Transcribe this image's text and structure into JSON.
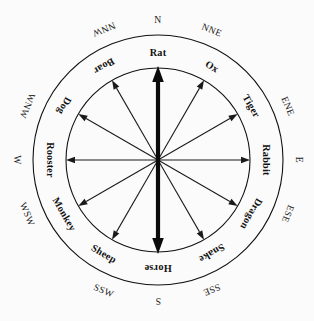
{
  "figure": {
    "background_color": "#fbfbfb",
    "line_color": "#111111"
  },
  "chart_data": {
    "type": "pie",
    "title": "",
    "subtitle": "",
    "xlabel": "",
    "ylabel": "",
    "grid": false,
    "legend_position": "none",
    "center": {
      "x": 158,
      "y": 160
    },
    "radii": {
      "inner_ring": 92,
      "outer_ring": 125,
      "arrow_length": 92
    },
    "categories": [
      "Rat",
      "Ox",
      "Tiger",
      "Rabbit",
      "Dragon",
      "Snake",
      "Horse",
      "Sheep",
      "Monkey",
      "Rooster",
      "Dog",
      "Boar"
    ],
    "values": [
      30,
      30,
      30,
      30,
      30,
      30,
      30,
      30,
      30,
      30,
      30,
      30
    ],
    "annotations": [
      "Rat at N (0 deg)",
      "Horse at S (180 deg)",
      "Rabbit at E (90 deg)",
      "Rooster at W (270 deg)"
    ]
  },
  "inner_ring": {
    "name": "zodiac-ring",
    "items": [
      {
        "label": "Rat",
        "angle_deg": 0
      },
      {
        "label": "Ox",
        "angle_deg": 30
      },
      {
        "label": "Tiger",
        "angle_deg": 60
      },
      {
        "label": "Rabbit",
        "angle_deg": 90
      },
      {
        "label": "Dragon",
        "angle_deg": 120
      },
      {
        "label": "Snake",
        "angle_deg": 150
      },
      {
        "label": "Horse",
        "angle_deg": 180
      },
      {
        "label": "Sheep",
        "angle_deg": 210
      },
      {
        "label": "Monkey",
        "angle_deg": 240
      },
      {
        "label": "Rooster",
        "angle_deg": 270
      },
      {
        "label": "Dog",
        "angle_deg": 300
      },
      {
        "label": "Boar",
        "angle_deg": 330
      }
    ]
  },
  "outer_ring": {
    "name": "compass-ring",
    "items": [
      {
        "label": "N",
        "angle_deg": 0
      },
      {
        "label": "NNE",
        "angle_deg": 22.5
      },
      {
        "label": "ENE",
        "angle_deg": 67.5
      },
      {
        "label": "E",
        "angle_deg": 90
      },
      {
        "label": "ESE",
        "angle_deg": 112.5
      },
      {
        "label": "SSE",
        "angle_deg": 157.5
      },
      {
        "label": "S",
        "angle_deg": 180
      },
      {
        "label": "SSW",
        "angle_deg": 202.5
      },
      {
        "label": "WSW",
        "angle_deg": 247.5
      },
      {
        "label": "W",
        "angle_deg": 270
      },
      {
        "label": "WNW",
        "angle_deg": 292.5
      },
      {
        "label": "NNW",
        "angle_deg": 337.5
      }
    ]
  },
  "arrows": {
    "name": "radial-arrows",
    "bold_axis": {
      "label": "north-south-axis",
      "double_headed": true,
      "angle_deg": 0
    },
    "thin_count": 10
  }
}
